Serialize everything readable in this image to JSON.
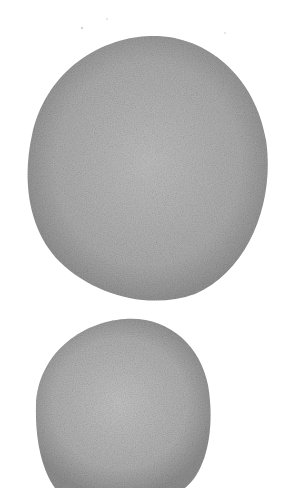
{
  "image": {
    "description": "Grayscale speckled micrograph of two rounded cell-like blobs on a white background",
    "background_color": "#ffffff",
    "objects": [
      {
        "name": "upper-cell",
        "shape": "rounded irregular oval",
        "fill_color": "#a8a8a8",
        "edge_color": "#8a8a8a",
        "inner_color": "#bdbdbd"
      },
      {
        "name": "lower-cell",
        "shape": "rounded irregular oval, partly cropped at bottom",
        "fill_color": "#acacac",
        "edge_color": "#8c8c8c",
        "inner_color": "#c2c2c2"
      }
    ]
  }
}
